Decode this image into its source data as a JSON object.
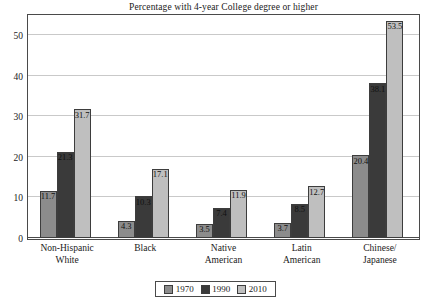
{
  "chart_data": {
    "type": "bar",
    "title": "Percentage with 4-year College degree or higher",
    "xlabel": "",
    "ylabel": "",
    "ylim": [
      0,
      55
    ],
    "yticks": [
      0,
      10,
      20,
      30,
      40,
      50
    ],
    "grid": true,
    "legend_position": "bottom",
    "categories": [
      "Non-Hispanic White",
      "Black",
      "Native American",
      "Latin American",
      "Chinese/ Japanese"
    ],
    "category_lines": [
      [
        "Non-Hispanic",
        "White"
      ],
      [
        "Black",
        ""
      ],
      [
        "Native",
        "American"
      ],
      [
        "Latin",
        "American"
      ],
      [
        "Chinese/",
        "Japanese"
      ]
    ],
    "series": [
      {
        "name": "1970",
        "color": "#8c8c8c",
        "values": [
          11.7,
          4.3,
          3.5,
          3.7,
          20.4
        ]
      },
      {
        "name": "1990",
        "color": "#3a3a3a",
        "values": [
          21.3,
          10.3,
          7.4,
          8.5,
          38.1
        ]
      },
      {
        "name": "2010",
        "color": "#bfbfbf",
        "values": [
          31.7,
          17.1,
          11.9,
          12.7,
          53.5
        ]
      }
    ]
  },
  "legend": {
    "items": [
      {
        "label": "1970"
      },
      {
        "label": "1990"
      },
      {
        "label": "2010"
      }
    ]
  },
  "axis": {
    "tick_labels": [
      "0",
      "10",
      "20",
      "30",
      "40",
      "50"
    ]
  }
}
